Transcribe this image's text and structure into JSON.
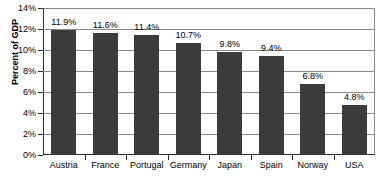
{
  "chart_data": {
    "type": "bar",
    "title": "",
    "xlabel": "",
    "ylabel": "Percent of GDP",
    "categories": [
      "Austria",
      "France",
      "Portugal",
      "Germany",
      "Japan",
      "Spain",
      "Norway",
      "USA"
    ],
    "values": [
      11.9,
      11.6,
      11.4,
      10.7,
      9.8,
      9.4,
      6.8,
      4.8
    ],
    "data_labels": [
      "11.9%",
      "11.6%",
      "11.4%",
      "10.7%",
      "9.8%",
      "9.4%",
      "6.8%",
      "4.8%"
    ],
    "ylim": [
      0,
      14
    ],
    "ytick_values": [
      0,
      2,
      4,
      6,
      8,
      10,
      12,
      14
    ],
    "ytick_labels": [
      "0%",
      "2%",
      "4%",
      "6%",
      "8%",
      "10%",
      "12%",
      "14%"
    ],
    "grid": true,
    "legend": "none",
    "bar_color": "#3b3b3b",
    "grid_color": "#8a8a8a",
    "axis_color": "#2b2b2b",
    "background": "#ffffff"
  }
}
